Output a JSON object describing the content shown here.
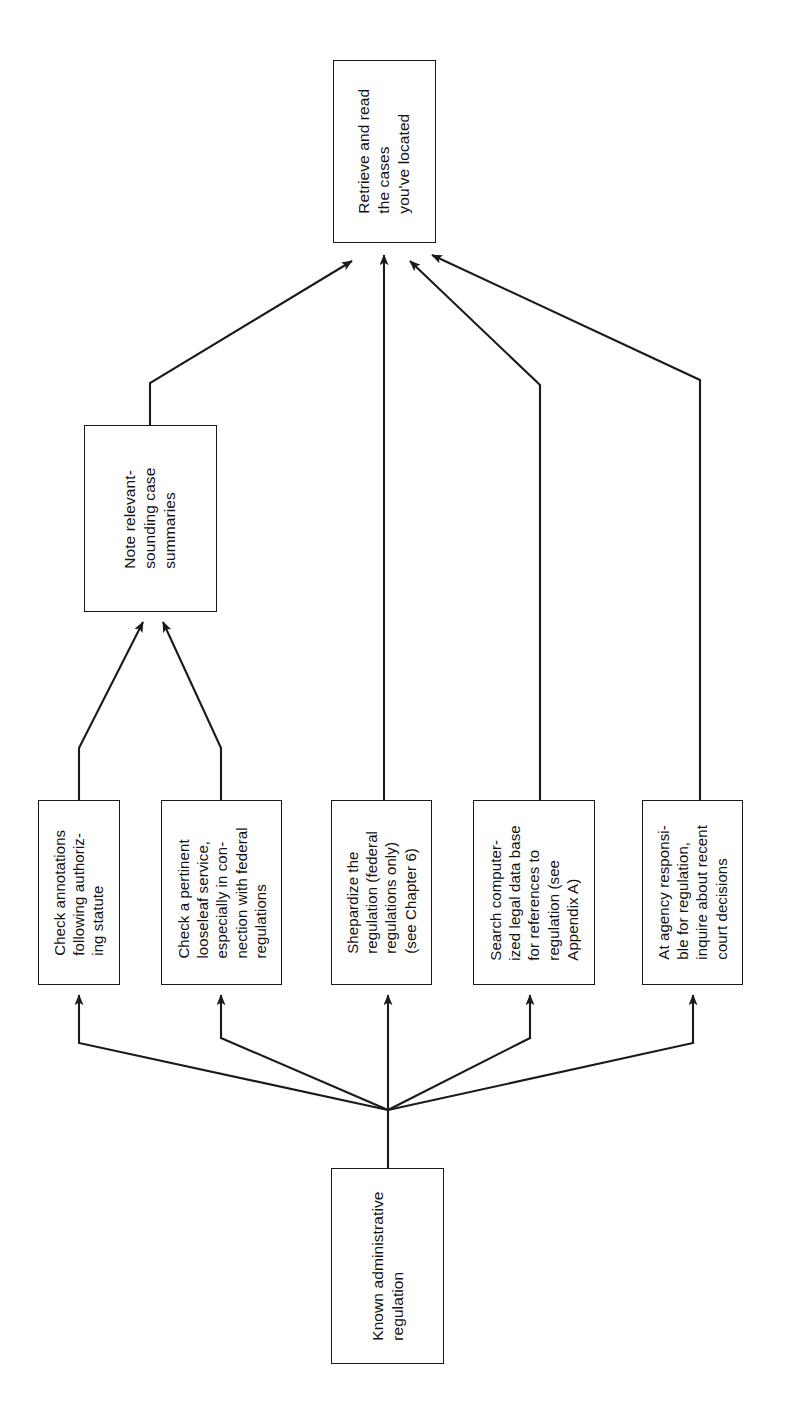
{
  "diagram": {
    "orientation": "rotated-90-ccw",
    "line_color": "#1a1a1a",
    "box_fill": "#ffffff",
    "nodes": [
      {
        "id": "retrieve-read-cases",
        "label": "Retrieve and read\nthe cases\nyou've located",
        "lines": [
          "Retrieve and read",
          "the cases",
          "you've located"
        ]
      },
      {
        "id": "note-summaries",
        "label": "Note relevant-\nsounding case\nsummaries",
        "lines": [
          "Note relevant-",
          "sounding case",
          "summaries"
        ]
      },
      {
        "id": "check-annotations",
        "label": "Check annotations\nfollowing authoriz-\ning statute",
        "lines": [
          "Check annotations",
          "following authoriz-",
          "ing statute"
        ]
      },
      {
        "id": "check-looseleaf",
        "label": "Check a pertinent\nlooseleaf service,\nespecially in con-\nnection with federal\nregulations",
        "lines": [
          "Check a pertinent",
          "looseleaf service,",
          "especially in con-",
          "nection with federal",
          "regulations"
        ]
      },
      {
        "id": "shepardize",
        "label": "Shepardize the\nregulation (federal\nregulations only)\n(see Chapter 6)",
        "lines": [
          "Shepardize the",
          "regulation (federal",
          "regulations only)",
          "(see Chapter 6)"
        ]
      },
      {
        "id": "search-computerized",
        "label": "Search computer-\nized legal data base\nfor references to\nregulation (see\nAppendix A)",
        "lines": [
          "Search computer-",
          "ized legal data base",
          "for references to",
          "regulation (see",
          "Appendix A)"
        ]
      },
      {
        "id": "agency-inquire",
        "label": "At agency responsi-\nble for regulation,\ninquire about recent\ncourt decisions",
        "lines": [
          "At agency responsi-",
          "ble for regulation,",
          "inquire about recent",
          "court decisions"
        ]
      },
      {
        "id": "known-regulation",
        "label": "Known administrative\nregulation",
        "lines": [
          "Known administrative",
          "regulation"
        ]
      }
    ],
    "edges": [
      {
        "from": "known-regulation",
        "to": "check-annotations"
      },
      {
        "from": "known-regulation",
        "to": "check-looseleaf"
      },
      {
        "from": "known-regulation",
        "to": "shepardize"
      },
      {
        "from": "known-regulation",
        "to": "search-computerized"
      },
      {
        "from": "known-regulation",
        "to": "agency-inquire"
      },
      {
        "from": "check-annotations",
        "to": "note-summaries"
      },
      {
        "from": "check-looseleaf",
        "to": "note-summaries"
      },
      {
        "from": "note-summaries",
        "to": "retrieve-read-cases"
      },
      {
        "from": "shepardize",
        "to": "retrieve-read-cases"
      },
      {
        "from": "search-computerized",
        "to": "retrieve-read-cases"
      },
      {
        "from": "agency-inquire",
        "to": "retrieve-read-cases"
      }
    ]
  }
}
